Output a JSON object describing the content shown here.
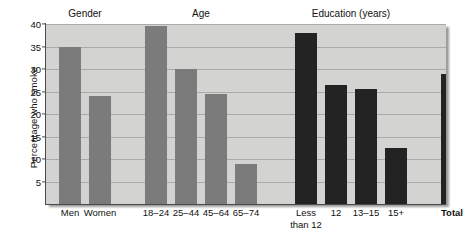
{
  "chart_data": {
    "type": "bar",
    "title": "",
    "xlabel": "",
    "ylabel": "Percentage who smoke",
    "ylim": [
      0,
      40
    ],
    "grid": true,
    "legend": "none",
    "y_ticks": [
      5,
      10,
      15,
      20,
      25,
      30,
      35,
      40
    ],
    "group_headers": [
      "Gender",
      "Age",
      "Education (years)"
    ],
    "categories": [
      "Men",
      "Women",
      "18–24",
      "25–44",
      "45–64",
      "65–74",
      "Less\nthan 12",
      "12",
      "13–15",
      "15+",
      "Total"
    ],
    "values": [
      35,
      24,
      39.5,
      30,
      24.5,
      9,
      38,
      26.5,
      25.5,
      12.5,
      29
    ],
    "bar_styles": [
      "light",
      "light",
      "light",
      "light",
      "light",
      "light",
      "dark",
      "dark",
      "dark",
      "dark",
      "dark"
    ],
    "colors": {
      "bar_light": "#7b7b7b",
      "bar_dark": "#232323",
      "plot_background": "#d3d3d1",
      "gridline": "#a9a9a7",
      "axis": "#4a4a4a",
      "text": "#111111"
    }
  }
}
